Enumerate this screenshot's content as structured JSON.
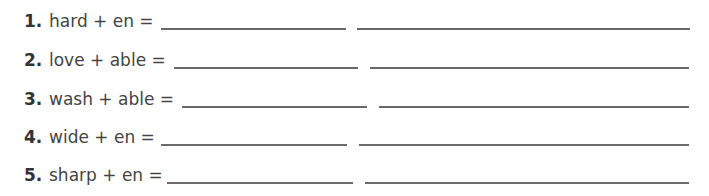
{
  "exercises": [
    {
      "number": "1.",
      "expression": "hard + en =",
      "top": 11,
      "expr_left": 49,
      "line1": [
        161,
        346
      ],
      "line2": [
        357,
        690
      ]
    },
    {
      "number": "2.",
      "expression": "love + able =",
      "top": 50,
      "expr_left": 49,
      "line1": [
        174,
        358
      ],
      "line2": [
        370,
        689
      ]
    },
    {
      "number": "3.",
      "expression": "wash + able =",
      "top": 89,
      "expr_left": 49,
      "line1": [
        182,
        367
      ],
      "line2": [
        379,
        689
      ]
    },
    {
      "number": "4.",
      "expression": "wide + en =",
      "top": 127,
      "expr_left": 49,
      "line1": [
        161,
        347
      ],
      "line2": [
        359,
        689
      ]
    },
    {
      "number": "5.",
      "expression": "sharp + en =",
      "top": 165,
      "expr_left": 49,
      "line1": [
        167,
        353
      ],
      "line2": [
        365,
        689
      ]
    }
  ]
}
